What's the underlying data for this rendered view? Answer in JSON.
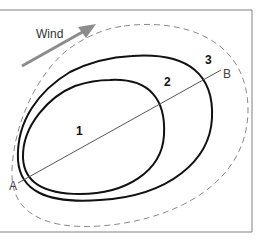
{
  "diagram": {
    "wind_label": "Wind",
    "zone_labels": [
      "1",
      "2",
      "3"
    ],
    "point_a": "A",
    "point_b": "B",
    "colors": {
      "frame": "#808080",
      "arrow": "#8c8c8c",
      "contour": "#111111",
      "dashed": "#8a8a8a",
      "axis_line": "#555555"
    }
  }
}
